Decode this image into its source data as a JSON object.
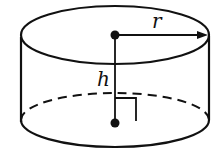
{
  "diagram": {
    "type": "cylinder",
    "labels": {
      "radius": "r",
      "height": "h"
    },
    "colors": {
      "stroke": "#111111",
      "background": "#ffffff"
    }
  }
}
